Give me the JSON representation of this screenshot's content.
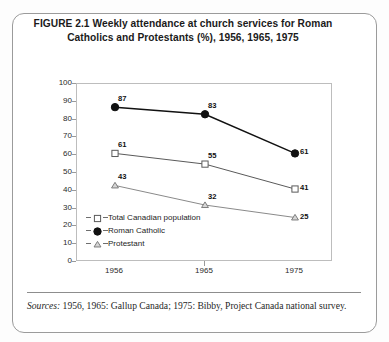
{
  "figure": {
    "title_line_1": "FIGURE 2.1  Weekly attendance at church services for Roman",
    "title_line_2": "Catholics and Protestants (%), 1956, 1965, 1975",
    "source_label": "Sources:",
    "source_text": " 1956, 1965: Gallup Canada; 1975: Bibby, Project Canada national survey."
  },
  "chart_data": {
    "type": "line",
    "title": "FIGURE 2.1  Weekly attendance at church services for Roman Catholics and Protestants (%), 1956, 1965, 1975",
    "xlabel": "",
    "ylabel": "",
    "categories": [
      "1956",
      "1965",
      "1975"
    ],
    "x": [
      1956,
      1965,
      1975
    ],
    "ylim": [
      0,
      100
    ],
    "yticks": [
      0,
      10,
      20,
      30,
      40,
      50,
      60,
      70,
      80,
      90,
      100
    ],
    "ytick_labels": [
      "0",
      "10",
      "20",
      "30",
      "40",
      "50",
      "60",
      "70",
      "80",
      "90",
      "100"
    ],
    "grid": false,
    "legend_position": "inside-lower-left",
    "series": [
      {
        "name": "Total Canadian population",
        "marker": "open-square",
        "values": [
          61,
          55,
          41
        ],
        "labels": [
          "61",
          "55",
          "41"
        ],
        "color": "#5a5a5a"
      },
      {
        "name": "Roman Catholic",
        "marker": "filled-circle",
        "values": [
          87,
          83,
          61
        ],
        "labels": [
          "87",
          "83",
          "61"
        ],
        "color": "#111111"
      },
      {
        "name": "Protestant",
        "marker": "open-triangle",
        "values": [
          43,
          32,
          25
        ],
        "labels": [
          "43",
          "32",
          "25"
        ],
        "color": "#8a8a8a"
      }
    ]
  }
}
